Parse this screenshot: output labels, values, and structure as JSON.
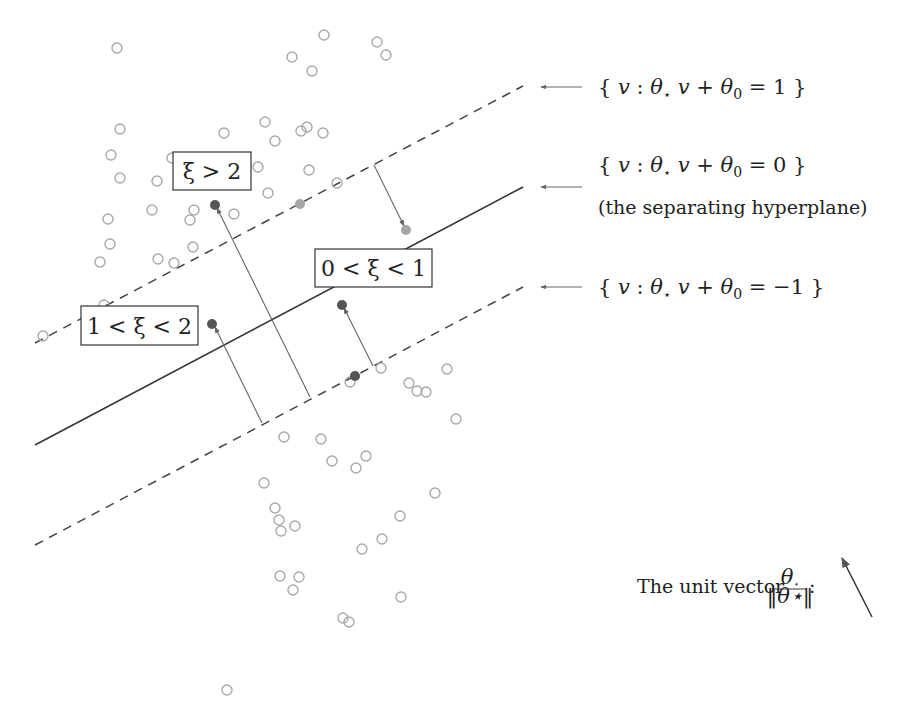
{
  "diagram": {
    "colors": {
      "hollow_point": "#a9a9a9",
      "dark_point": "#555555",
      "light_point": "#a6a6a6",
      "line": "#333333",
      "arrow": "#666666"
    },
    "lines": {
      "upper_margin": {
        "label": "{ v : θ⋆ v + θ0 = 1 }",
        "x1": 35,
        "y1": 343,
        "x2": 523,
        "y2": 86,
        "style": "dashed"
      },
      "hyperplane": {
        "label": "{ v : θ⋆ v + θ0 = 0 }",
        "sublabel": "(the separating hyperplane)",
        "x1": 35,
        "y1": 445,
        "x2": 523,
        "y2": 187,
        "style": "solid"
      },
      "lower_margin": {
        "label": "{ v : θ⋆ v + θ0 = −1 }",
        "x1": 35,
        "y1": 545,
        "x2": 523,
        "y2": 287,
        "style": "dashed"
      }
    },
    "labels": {
      "upper_margin": {
        "pre": "{ ",
        "v": "v",
        "colon": " : ",
        "theta": "θ",
        "star": "⋆",
        "v2": " v",
        "plus": " + ",
        "theta0": "θ",
        "sub0": "0",
        "eq": " = 1 }"
      },
      "hyperplane": {
        "pre": "{ ",
        "v": "v",
        "colon": " : ",
        "theta": "θ",
        "star": "⋆",
        "v2": " v",
        "plus": " + ",
        "theta0": "θ",
        "sub0": "0",
        "eq": " = 0 }",
        "sub": "(the separating hyperplane)"
      },
      "lower_margin": {
        "pre": "{ ",
        "v": "v",
        "colon": " : ",
        "theta": "θ",
        "star": "⋆",
        "v2": " v",
        "plus": " + ",
        "theta0": "θ",
        "sub0": "0",
        "eq": " = −1 }"
      },
      "unit_vector": {
        "text": "The unit vector ",
        "num_theta": "θ",
        "num_star": "⋆",
        "den": "‖θ⋆‖",
        "colon": ":"
      }
    },
    "boxes": [
      {
        "id": "xi-gt-2",
        "text": "ξ > 2",
        "x": 173,
        "y": 152,
        "w": 78,
        "h": 38
      },
      {
        "id": "xi-1-2",
        "text": "1 < ξ < 2",
        "x": 81,
        "y": 306,
        "w": 117,
        "h": 39
      },
      {
        "id": "xi-0-1",
        "text": "0 < ξ < 1",
        "x": 315,
        "y": 249,
        "w": 117,
        "h": 38
      }
    ],
    "hollow_points": [
      [
        117,
        48
      ],
      [
        324,
        35
      ],
      [
        377,
        42
      ],
      [
        386,
        55
      ],
      [
        292,
        57
      ],
      [
        312,
        71
      ],
      [
        120,
        129
      ],
      [
        224,
        133
      ],
      [
        265,
        122
      ],
      [
        307,
        127
      ],
      [
        301,
        131
      ],
      [
        323,
        133
      ],
      [
        275,
        141
      ],
      [
        111,
        155
      ],
      [
        172,
        158
      ],
      [
        258,
        167
      ],
      [
        120,
        178
      ],
      [
        157,
        181
      ],
      [
        268,
        193
      ],
      [
        309,
        170
      ],
      [
        337,
        183
      ],
      [
        108,
        219
      ],
      [
        152,
        210
      ],
      [
        190,
        220
      ],
      [
        194,
        210
      ],
      [
        234,
        214
      ],
      [
        193,
        247
      ],
      [
        110,
        244
      ],
      [
        100,
        262
      ],
      [
        158,
        259
      ],
      [
        174,
        263
      ],
      [
        43,
        336
      ],
      [
        104,
        305
      ],
      [
        350,
        382
      ],
      [
        381,
        368
      ],
      [
        409,
        383
      ],
      [
        417,
        391
      ],
      [
        426,
        392
      ],
      [
        447,
        369
      ],
      [
        456,
        419
      ],
      [
        284,
        437
      ],
      [
        321,
        439
      ],
      [
        332,
        461
      ],
      [
        356,
        468
      ],
      [
        366,
        456
      ],
      [
        264,
        483
      ],
      [
        275,
        508
      ],
      [
        279,
        520
      ],
      [
        281,
        531
      ],
      [
        295,
        526
      ],
      [
        400,
        516
      ],
      [
        435,
        493
      ],
      [
        382,
        539
      ],
      [
        362,
        549
      ],
      [
        280,
        576
      ],
      [
        299,
        577
      ],
      [
        293,
        590
      ],
      [
        401,
        597
      ],
      [
        343,
        618
      ],
      [
        349,
        622
      ],
      [
        227,
        690
      ]
    ],
    "filled_points": [
      {
        "x": 215,
        "y": 205,
        "shade": "dark"
      },
      {
        "x": 212,
        "y": 324,
        "shade": "dark"
      },
      {
        "x": 342,
        "y": 305,
        "shade": "dark"
      },
      {
        "x": 355,
        "y": 376,
        "shade": "dark"
      },
      {
        "x": 300,
        "y": 204,
        "shade": "light"
      },
      {
        "x": 406,
        "y": 230,
        "shade": "light"
      }
    ],
    "slack_arrows": [
      {
        "x1": 310,
        "y1": 397,
        "x2": 217,
        "y2": 208
      },
      {
        "x1": 262,
        "y1": 423,
        "x2": 215,
        "y2": 327
      },
      {
        "x1": 373,
        "y1": 366,
        "x2": 344,
        "y2": 308
      },
      {
        "x1": 374,
        "y1": 165,
        "x2": 404,
        "y2": 226
      }
    ],
    "label_arrows": [
      {
        "x1": 582,
        "y1": 87,
        "x2": 541,
        "y2": 87
      },
      {
        "x1": 582,
        "y1": 187,
        "x2": 541,
        "y2": 187
      },
      {
        "x1": 582,
        "y1": 287,
        "x2": 541,
        "y2": 287
      }
    ],
    "unit_vector_arrow": {
      "x1": 872,
      "y1": 617,
      "x2": 842,
      "y2": 558
    }
  }
}
